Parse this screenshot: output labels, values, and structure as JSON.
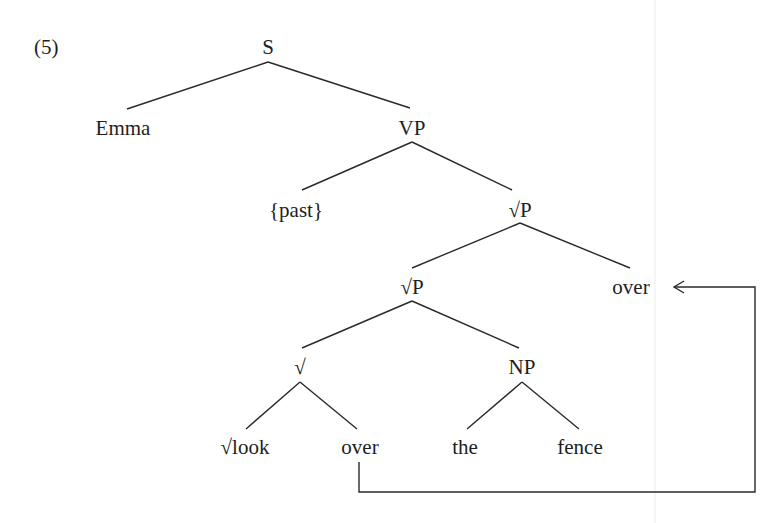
{
  "example_number": "(5)",
  "tree": {
    "nodes": {
      "S": {
        "label": "S",
        "x": 268,
        "y": 54
      },
      "Emma": {
        "label": "Emma",
        "x": 123,
        "y": 135
      },
      "VP": {
        "label": "VP",
        "x": 412,
        "y": 135
      },
      "past": {
        "label": "{past}",
        "x": 296,
        "y": 217
      },
      "rootP1": {
        "label": "√P",
        "x": 520,
        "y": 217
      },
      "rootP2": {
        "label": "√P",
        "x": 412,
        "y": 294
      },
      "over_top": {
        "label": "over",
        "x": 631,
        "y": 294
      },
      "root": {
        "label": "√",
        "x": 300,
        "y": 374
      },
      "NP": {
        "label": "NP",
        "x": 522,
        "y": 374
      },
      "look": {
        "label": "√look",
        "x": 245,
        "y": 454
      },
      "over_low": {
        "label": "over",
        "x": 360,
        "y": 454
      },
      "the": {
        "label": "the",
        "x": 465,
        "y": 454
      },
      "fence": {
        "label": "fence",
        "x": 580,
        "y": 454
      }
    }
  },
  "movement_arrow": {
    "from": "over_low",
    "to": "over_top",
    "description": "movement of particle 'over' from lower position to sentence-final position"
  }
}
